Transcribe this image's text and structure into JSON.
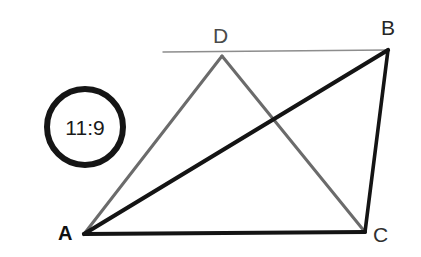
{
  "diagram": {
    "canvas": {
      "width": 421,
      "height": 257,
      "background": "#ffffff"
    },
    "badge": {
      "label": "11:9",
      "shape": "circle",
      "stroke_color": "#151515",
      "text_color": "#1a1a1a",
      "center": {
        "x": 85,
        "y": 127
      },
      "radius": 41
    },
    "vertices": [
      {
        "id": "A",
        "label": "A",
        "x": 84,
        "y": 234,
        "label_x": 66,
        "label_y": 233,
        "label_color": "#101010",
        "bold": true
      },
      {
        "id": "B",
        "label": "B",
        "x": 388,
        "y": 50,
        "label_x": 389,
        "label_y": 28,
        "label_color": "#262626",
        "bold": false
      },
      {
        "id": "C",
        "label": "C",
        "x": 365,
        "y": 232,
        "label_x": 381,
        "label_y": 235,
        "label_color": "#303030",
        "bold": false
      },
      {
        "id": "D",
        "label": "D",
        "x": 222,
        "y": 56,
        "label_x": 221,
        "label_y": 36,
        "label_color": "#4a4a4a",
        "bold": false
      }
    ],
    "segments": [
      {
        "id": "AC",
        "from": "A",
        "to": "C",
        "color": "#141414",
        "width": 4.0,
        "style": "solid",
        "role": "base-side"
      },
      {
        "id": "AB",
        "from": "A",
        "to": "B",
        "color": "#141414",
        "width": 4.2,
        "style": "solid",
        "role": "diagonal"
      },
      {
        "id": "BC",
        "from": "B",
        "to": "C",
        "color": "#141414",
        "width": 3.6,
        "style": "solid",
        "role": "right-side"
      },
      {
        "id": "AD",
        "from": "A",
        "to": "D",
        "color": "#6b6b6b",
        "width": 3.0,
        "style": "solid",
        "role": "light-side"
      },
      {
        "id": "DC",
        "from": "D",
        "to": "C",
        "color": "#6b6b6b",
        "width": 3.0,
        "style": "solid",
        "role": "light-diagonal"
      },
      {
        "id": "DB-extended",
        "from": "extension-left",
        "to": "B",
        "color": "#8d8d8d",
        "width": 1.4,
        "style": "solid",
        "role": "construction-line",
        "x1": 163,
        "y1": 52,
        "x2": 388,
        "y2": 50
      }
    ],
    "intersection": {
      "x": 270,
      "y": 127,
      "of": [
        "AB",
        "DC"
      ]
    }
  }
}
